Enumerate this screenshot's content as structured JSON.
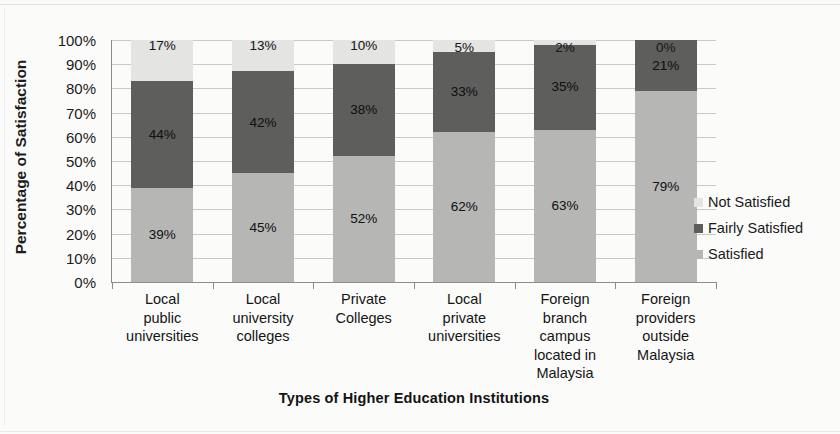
{
  "chart_data": {
    "type": "bar",
    "subtype": "stacked-bar-100",
    "title": "",
    "xlabel": "Types of Higher Education Institutions",
    "ylabel": "Percentage of Satisfaction",
    "ylim": [
      0,
      100
    ],
    "ytick_labels": [
      "0%",
      "10%",
      "20%",
      "30%",
      "40%",
      "50%",
      "60%",
      "70%",
      "80%",
      "90%",
      "100%"
    ],
    "ytick_values": [
      0,
      10,
      20,
      30,
      40,
      50,
      60,
      70,
      80,
      90,
      100
    ],
    "grid": true,
    "legend_position": "right",
    "categories": [
      "Local public universities",
      "Local university colleges",
      "Private Colleges",
      "Local private universities",
      "Foreign branch campus located in Malaysia",
      "Foreign providers outside Malaysia"
    ],
    "category_lines": [
      [
        "Local",
        "public",
        "universities"
      ],
      [
        "Local",
        "university",
        "colleges"
      ],
      [
        "Private",
        "Colleges"
      ],
      [
        "Local",
        "private",
        "universities"
      ],
      [
        "Foreign",
        "branch",
        "campus",
        "located in",
        "Malaysia"
      ],
      [
        "Foreign",
        "providers",
        "outside",
        "Malaysia"
      ]
    ],
    "series": [
      {
        "name": "Satisfied",
        "color": "#b6b6b4",
        "values": [
          39,
          45,
          52,
          62,
          63,
          79
        ],
        "labels": [
          "39%",
          "45%",
          "52%",
          "62%",
          "63%",
          "79%"
        ]
      },
      {
        "name": "Fairly Satisfied",
        "color": "#5e5e5c",
        "values": [
          44,
          42,
          38,
          33,
          35,
          21
        ],
        "labels": [
          "44%",
          "42%",
          "38%",
          "33%",
          "35%",
          "21%"
        ]
      },
      {
        "name": "Not Satisfied",
        "color": "#e4e4e2",
        "values": [
          17,
          13,
          10,
          5,
          2,
          0
        ],
        "labels": [
          "17%",
          "13%",
          "10%",
          "5%",
          "2%",
          "0%"
        ]
      }
    ]
  },
  "legend": {
    "items": [
      {
        "label": "Not Satisfied",
        "color": "#e4e4e2"
      },
      {
        "label": "Fairly Satisfied",
        "color": "#5e5e5c"
      },
      {
        "label": "Satisfied",
        "color": "#b6b6b4"
      }
    ]
  }
}
